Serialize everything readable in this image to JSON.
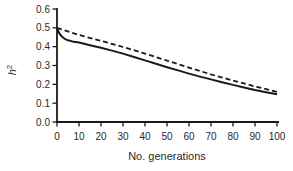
{
  "chart_data": {
    "type": "line",
    "title": "",
    "xlabel": "No. generations",
    "ylabel": {
      "base": "h",
      "sup": "2"
    },
    "xlim": [
      0,
      100
    ],
    "ylim": [
      0.0,
      0.6
    ],
    "grid": false,
    "legend": "none",
    "axis_color": "#1a1a1a",
    "text_color": "#2a2a2a",
    "x_ticks": [
      {
        "value": 0,
        "label": "0"
      },
      {
        "value": 10,
        "label": "10"
      },
      {
        "value": 20,
        "label": "20"
      },
      {
        "value": 30,
        "label": "30"
      },
      {
        "value": 40,
        "label": "40"
      },
      {
        "value": 50,
        "label": "50"
      },
      {
        "value": 60,
        "label": "60"
      },
      {
        "value": 70,
        "label": "70"
      },
      {
        "value": 80,
        "label": "80"
      },
      {
        "value": 90,
        "label": "90"
      },
      {
        "value": 100,
        "label": "100"
      }
    ],
    "y_ticks": [
      {
        "value": 0.0,
        "label": "0.0"
      },
      {
        "value": 0.1,
        "label": "0.1"
      },
      {
        "value": 0.2,
        "label": "0.2"
      },
      {
        "value": 0.3,
        "label": "0.3"
      },
      {
        "value": 0.4,
        "label": "0.4"
      },
      {
        "value": 0.5,
        "label": "0.5"
      },
      {
        "value": 0.6,
        "label": "0.6"
      }
    ],
    "series": [
      {
        "name": "dashed-line",
        "style": "dashed",
        "color": "#1a1a1a",
        "width": 1.8,
        "x": [
          0,
          10,
          20,
          30,
          40,
          50,
          60,
          70,
          80,
          90,
          100
        ],
        "y": [
          0.5,
          0.462,
          0.431,
          0.398,
          0.363,
          0.326,
          0.289,
          0.253,
          0.22,
          0.189,
          0.16
        ]
      },
      {
        "name": "solid-line",
        "style": "solid",
        "color": "#1a1a1a",
        "width": 2,
        "x": [
          0,
          1,
          2,
          3,
          4,
          5,
          7,
          10,
          15,
          20,
          25,
          30,
          35,
          40,
          45,
          50,
          55,
          60,
          65,
          70,
          75,
          80,
          85,
          90,
          95,
          100
        ],
        "y": [
          0.5,
          0.472,
          0.456,
          0.446,
          0.439,
          0.434,
          0.428,
          0.422,
          0.408,
          0.394,
          0.379,
          0.363,
          0.345,
          0.327,
          0.309,
          0.291,
          0.274,
          0.257,
          0.241,
          0.226,
          0.211,
          0.197,
          0.183,
          0.17,
          0.158,
          0.147
        ]
      }
    ]
  }
}
